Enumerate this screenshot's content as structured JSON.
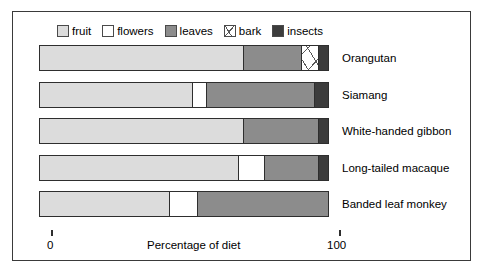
{
  "chart_data": {
    "type": "bar",
    "orientation": "horizontal",
    "stacked": true,
    "title": "",
    "xlabel": "Percentage of diet",
    "ylabel": "",
    "xlim": [
      0,
      100
    ],
    "xticks": [
      0,
      100
    ],
    "xtick_labels": [
      "0",
      "100"
    ],
    "grid": false,
    "legend_position": "top-left",
    "categories": [
      "Orangutan",
      "Siamang",
      "White-handed gibbon",
      "Long-tailed macaque",
      "Banded leaf monkey"
    ],
    "series": [
      {
        "name": "fruit",
        "color": "#dcdcdc",
        "values": [
          71,
          53,
          71,
          69,
          45
        ]
      },
      {
        "name": "flowers",
        "color": "#ffffff",
        "values": [
          0,
          5,
          0,
          9,
          10
        ]
      },
      {
        "name": "leaves",
        "color": "#8c8c8c",
        "values": [
          20,
          37.5,
          26,
          19,
          45
        ]
      },
      {
        "name": "bark",
        "color": "#ffffff",
        "pattern": "hatched",
        "values": [
          6,
          0,
          0,
          0,
          0
        ]
      },
      {
        "name": "insects",
        "color": "#3c3c3c",
        "values": [
          3,
          4.5,
          3,
          3,
          0
        ]
      }
    ],
    "legend": [
      {
        "label": "fruit",
        "swatch": "fill-fruit"
      },
      {
        "label": "flowers",
        "swatch": "fill-flowers"
      },
      {
        "label": "leaves",
        "swatch": "fill-leaves"
      },
      {
        "label": "bark",
        "swatch": "fill-bark"
      },
      {
        "label": "insects",
        "swatch": "fill-insects"
      }
    ]
  },
  "axis": {
    "min_label": "0",
    "max_label": "100",
    "title": "Percentage of diet"
  },
  "colors": {
    "fruit": "#dcdcdc",
    "flowers": "#ffffff",
    "leaves": "#8c8c8c",
    "bark": "#ffffff",
    "insects": "#3c3c3c",
    "outline": "#2e2e2e",
    "frame": "#3a3a3a"
  }
}
